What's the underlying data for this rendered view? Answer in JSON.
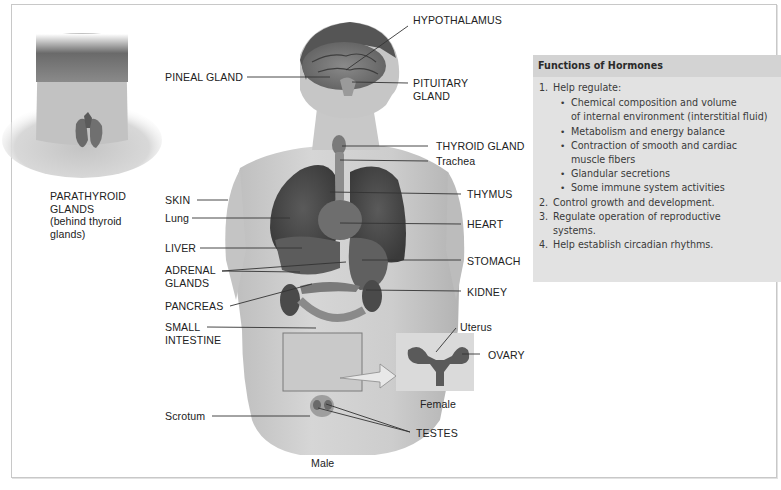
{
  "figure": {
    "neck_caption": "PARATHYROID\nGLANDS\n(behind thyroid\nglands)",
    "labels_left": [
      {
        "id": "pineal",
        "text": "PINEAL GLAND"
      },
      {
        "id": "skin",
        "text": "SKIN"
      },
      {
        "id": "lung",
        "text": "Lung"
      },
      {
        "id": "liver",
        "text": "LIVER"
      },
      {
        "id": "adrenal",
        "text": "ADRENAL\nGLANDS"
      },
      {
        "id": "pancreas",
        "text": "PANCREAS"
      },
      {
        "id": "small_intestine",
        "text": "SMALL\nINTESTINE"
      },
      {
        "id": "scrotum",
        "text": "Scrotum"
      }
    ],
    "labels_right": [
      {
        "id": "hypothalamus",
        "text": "HYPOTHALAMUS"
      },
      {
        "id": "pituitary",
        "text": "PITUITARY\nGLAND"
      },
      {
        "id": "thyroid",
        "text": "THYROID GLAND"
      },
      {
        "id": "trachea",
        "text": "Trachea"
      },
      {
        "id": "thymus",
        "text": "THYMUS"
      },
      {
        "id": "heart",
        "text": "HEART"
      },
      {
        "id": "stomach",
        "text": "STOMACH"
      },
      {
        "id": "kidney",
        "text": "KIDNEY"
      },
      {
        "id": "uterus",
        "text": "Uterus"
      },
      {
        "id": "ovary",
        "text": "OVARY"
      },
      {
        "id": "testes",
        "text": "TESTES"
      }
    ],
    "female_caption": "Female",
    "male_caption": "Male"
  },
  "infobox": {
    "title": "Functions of Hormones",
    "items": [
      {
        "num": "1.",
        "text": "Help regulate:",
        "bullets": [
          "Chemical composition and volume\nof internal environment (interstitial fluid)",
          "Metabolism and energy balance",
          "Contraction of smooth and cardiac\nmuscle fibers",
          "Glandular secretions",
          "Some immune system activities"
        ]
      },
      {
        "num": "2.",
        "text": "Control growth and development."
      },
      {
        "num": "3.",
        "text": "Regulate operation of reproductive\nsystems."
      },
      {
        "num": "4.",
        "text": "Help establish circadian rhythms."
      }
    ],
    "bullet_glyph": "•"
  },
  "colors": {
    "infobox_bg": "#e2e2e2",
    "infobox_title_bg": "#d3d3d3",
    "skin": "#c9c9c9",
    "organ_dark": "#4a4a4a"
  }
}
